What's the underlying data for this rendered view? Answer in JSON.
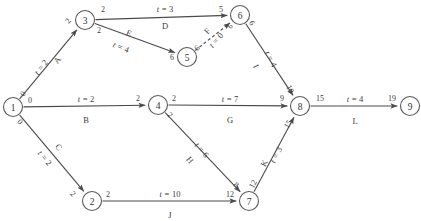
{
  "diagram": {
    "kind": "activity-on-arrow-network",
    "stroke_color": "#4a4a4a",
    "node_stroke_color": "#5a5a5a",
    "background": "#ffffff",
    "nodes": [
      {
        "id": "n1",
        "label": "1",
        "x": 13,
        "y": 107,
        "r": 9.5
      },
      {
        "id": "n2",
        "label": "2",
        "x": 92,
        "y": 201,
        "r": 9.5
      },
      {
        "id": "n3",
        "label": "3",
        "x": 85,
        "y": 20,
        "r": 9.5
      },
      {
        "id": "n4",
        "label": "4",
        "x": 158,
        "y": 105,
        "r": 9.5
      },
      {
        "id": "n5",
        "label": "5",
        "x": 187,
        "y": 57,
        "r": 9.5
      },
      {
        "id": "n6",
        "label": "6",
        "x": 240,
        "y": 15,
        "r": 9.5
      },
      {
        "id": "n7",
        "label": "7",
        "x": 249,
        "y": 201,
        "r": 9.5
      },
      {
        "id": "n8",
        "label": "8",
        "x": 300,
        "y": 106,
        "r": 9.5
      },
      {
        "id": "n9",
        "label": "9",
        "x": 410,
        "y": 106,
        "r": 9.5
      }
    ],
    "edges": [
      {
        "id": "A",
        "name": "A",
        "time_prefix": "t = ",
        "time": "2",
        "from": "n1",
        "to": "n3",
        "dashed": false,
        "name_x": 57,
        "name_y": 60,
        "name_rot": -52,
        "time_x": 41,
        "time_y": 67,
        "time_rot": -52,
        "tail_label": "0",
        "tail_x": 23,
        "tail_y": 94,
        "tail_rot": -52,
        "head_label": "2",
        "head_x": 68,
        "head_y": 21,
        "head_rot": -52
      },
      {
        "id": "B",
        "name": "B",
        "time_prefix": "t = ",
        "time": "2",
        "from": "n1",
        "to": "n4",
        "dashed": false,
        "name_x": 86,
        "name_y": 120,
        "name_rot": 0,
        "time_x": 86,
        "time_y": 99,
        "time_rot": 0,
        "tail_label": "0",
        "tail_x": 30,
        "tail_y": 100,
        "tail_rot": 0,
        "head_label": "2",
        "head_x": 138,
        "head_y": 98,
        "head_rot": 0
      },
      {
        "id": "C",
        "name": "C",
        "time_prefix": "t = ",
        "time": "2",
        "from": "n1",
        "to": "n2",
        "dashed": false,
        "name_x": 59,
        "name_y": 147,
        "name_rot": 50,
        "time_x": 45,
        "time_y": 158,
        "time_rot": 50,
        "tail_label": "0",
        "tail_x": 20,
        "tail_y": 122,
        "tail_rot": 50,
        "head_label": "2",
        "head_x": 73,
        "head_y": 194,
        "head_rot": 50
      },
      {
        "id": "D",
        "name": "D",
        "time_prefix": "t = ",
        "time": "3",
        "from": "n3",
        "to": "n6",
        "dashed": false,
        "name_x": 165,
        "name_y": 26,
        "name_rot": 0,
        "time_x": 165,
        "time_y": 9,
        "time_rot": 0,
        "tail_label": "2",
        "tail_x": 103,
        "tail_y": 9,
        "tail_rot": 0,
        "head_label": "5",
        "head_x": 221,
        "head_y": 9,
        "head_rot": 0
      },
      {
        "id": "E",
        "name": "E",
        "time_prefix": "t = ",
        "time": "4",
        "from": "n3",
        "to": "n5",
        "dashed": false,
        "name_x": 129,
        "name_y": 33,
        "name_rot": 22,
        "time_x": 121,
        "time_y": 47,
        "time_rot": 22,
        "tail_label": "2",
        "tail_x": 99,
        "tail_y": 30,
        "tail_rot": 0,
        "head_label": "6",
        "head_x": 172,
        "head_y": 57,
        "head_rot": 0
      },
      {
        "id": "F",
        "name": "F",
        "time_prefix": "t = ",
        "time": "0",
        "from": "n5",
        "to": "n6",
        "dashed": true,
        "name_x": 207,
        "name_y": 31,
        "name_rot": -48,
        "time_x": 216,
        "time_y": 40,
        "time_rot": -48,
        "tail_label": "6",
        "tail_x": 197,
        "tail_y": 48,
        "tail_rot": -48,
        "head_label": "6",
        "head_x": 230,
        "head_y": 26,
        "head_rot": -48
      },
      {
        "id": "G",
        "name": "G",
        "time_prefix": "t = ",
        "time": "7",
        "from": "n4",
        "to": "n8",
        "dashed": false,
        "name_x": 230,
        "name_y": 120,
        "name_rot": 0,
        "time_x": 230,
        "time_y": 99,
        "time_rot": 0,
        "tail_label": "2",
        "tail_x": 174,
        "tail_y": 98,
        "tail_rot": 0,
        "head_label": "9",
        "head_x": 282,
        "head_y": 98,
        "head_rot": 0
      },
      {
        "id": "H",
        "name": "H",
        "time_prefix": "t = ",
        "time": "6",
        "from": "n4",
        "to": "n7",
        "dashed": false,
        "name_x": 190,
        "name_y": 160,
        "name_rot": 50,
        "time_x": 202,
        "time_y": 150,
        "time_rot": 50,
        "tail_label": "2",
        "tail_x": 170,
        "tail_y": 115,
        "tail_rot": 50,
        "head_label": "8",
        "head_x": 236,
        "head_y": 185,
        "head_rot": 50
      },
      {
        "id": "I",
        "name": "I",
        "time_prefix": "t = ",
        "time": "4",
        "from": "n6",
        "to": "n8",
        "dashed": false,
        "name_x": 256,
        "name_y": 66,
        "name_rot": 62,
        "time_x": 271,
        "time_y": 59,
        "time_rot": 62,
        "tail_label": "6",
        "tail_x": 252,
        "tail_y": 23,
        "tail_rot": 62,
        "head_label": "10",
        "head_x": 290,
        "head_y": 89,
        "head_rot": 62
      },
      {
        "id": "J",
        "name": "J",
        "time_prefix": "t = ",
        "time": "10",
        "from": "n2",
        "to": "n7",
        "dashed": false,
        "name_x": 170,
        "name_y": 215,
        "name_rot": 0,
        "time_x": 170,
        "time_y": 194,
        "time_rot": 0,
        "tail_label": "2",
        "tail_x": 108,
        "tail_y": 194,
        "tail_rot": 0,
        "head_label": "12",
        "head_x": 230,
        "head_y": 194,
        "head_rot": 0
      },
      {
        "id": "K",
        "name": "K",
        "time_prefix": "t = ",
        "time": "3",
        "from": "n7",
        "to": "n8",
        "dashed": false,
        "name_x": 264,
        "name_y": 163,
        "name_rot": -62,
        "time_x": 276,
        "time_y": 155,
        "time_rot": -62,
        "tail_label": "12",
        "tail_x": 253,
        "tail_y": 184,
        "tail_rot": -62,
        "head_label": "15",
        "head_x": 288,
        "head_y": 124,
        "head_rot": -62
      },
      {
        "id": "L",
        "name": "L",
        "time_prefix": "t = ",
        "time": "4",
        "from": "n8",
        "to": "n9",
        "dashed": false,
        "name_x": 355,
        "name_y": 121,
        "name_rot": 0,
        "time_x": 355,
        "time_y": 99,
        "time_rot": 0,
        "tail_label": "15",
        "tail_x": 320,
        "tail_y": 98,
        "tail_rot": 0,
        "head_label": "19",
        "head_x": 392,
        "head_y": 98,
        "head_rot": 0
      }
    ]
  }
}
